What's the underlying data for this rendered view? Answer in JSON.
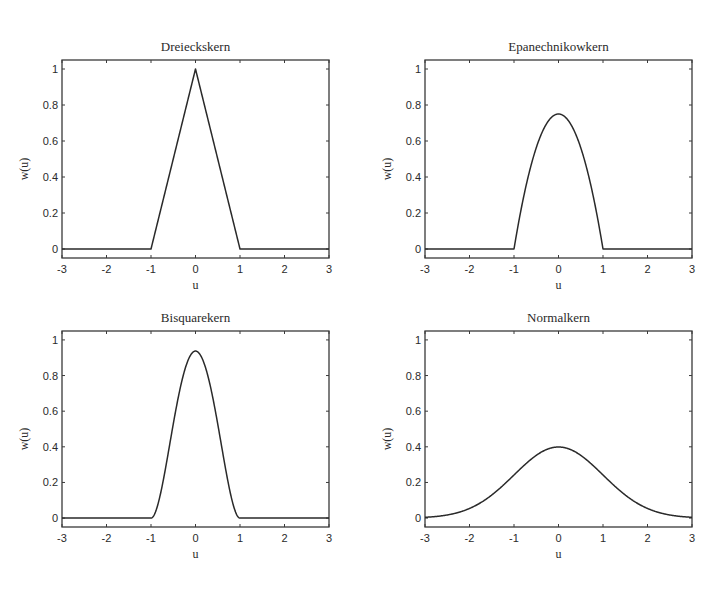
{
  "figure": {
    "background": "#ffffff",
    "line_color": "#2a2a2a"
  },
  "chart_data": [
    {
      "type": "line",
      "title": "Dreieckskern",
      "xlabel": "u",
      "ylabel": "w(u)",
      "xlim": [
        -3,
        3
      ],
      "ylim": [
        -0.05,
        1.05
      ],
      "xticks": [
        -3,
        -2,
        -1,
        0,
        1,
        2,
        3
      ],
      "xtick_labels": [
        "-3",
        "-2",
        "-1",
        "0",
        "1",
        "2",
        "3"
      ],
      "yticks": [
        0,
        0.2,
        0.4,
        0.6,
        0.8,
        1
      ],
      "ytick_labels": [
        "0",
        "0.2",
        "0.4",
        "0.6",
        "0.8",
        "1"
      ],
      "grid": false,
      "kernel": "triangular",
      "x": [
        -3,
        -1,
        0,
        1,
        3
      ],
      "y": [
        0,
        0,
        1,
        0,
        0
      ]
    },
    {
      "type": "line",
      "title": "Epanechnikowkern",
      "xlabel": "u",
      "ylabel": "w(u)",
      "xlim": [
        -3,
        3
      ],
      "ylim": [
        -0.05,
        1.05
      ],
      "xticks": [
        -3,
        -2,
        -1,
        0,
        1,
        2,
        3
      ],
      "xtick_labels": [
        "-3",
        "-2",
        "-1",
        "0",
        "1",
        "2",
        "3"
      ],
      "yticks": [
        0,
        0.2,
        0.4,
        0.6,
        0.8,
        1
      ],
      "ytick_labels": [
        "0",
        "0.2",
        "0.4",
        "0.6",
        "0.8",
        "1"
      ],
      "grid": false,
      "kernel": "epanechnikov",
      "x": [
        -3,
        -1,
        -0.75,
        -0.5,
        -0.25,
        0,
        0.25,
        0.5,
        0.75,
        1,
        3
      ],
      "y": [
        0,
        0,
        0.328,
        0.5625,
        0.703,
        0.75,
        0.703,
        0.5625,
        0.328,
        0,
        0
      ]
    },
    {
      "type": "line",
      "title": "Bisquarekern",
      "xlabel": "u",
      "ylabel": "w(u)",
      "xlim": [
        -3,
        3
      ],
      "ylim": [
        -0.05,
        1.05
      ],
      "xticks": [
        -3,
        -2,
        -1,
        0,
        1,
        2,
        3
      ],
      "xtick_labels": [
        "-3",
        "-2",
        "-1",
        "0",
        "1",
        "2",
        "3"
      ],
      "yticks": [
        0,
        0.2,
        0.4,
        0.6,
        0.8,
        1
      ],
      "ytick_labels": [
        "0",
        "0.2",
        "0.4",
        "0.6",
        "0.8",
        "1"
      ],
      "grid": false,
      "kernel": "biweight",
      "x": [
        -3,
        -1,
        -0.75,
        -0.5,
        -0.25,
        0,
        0.25,
        0.5,
        0.75,
        1,
        3
      ],
      "y": [
        0,
        0,
        0.179,
        0.527,
        0.824,
        0.9375,
        0.824,
        0.527,
        0.179,
        0,
        0
      ]
    },
    {
      "type": "line",
      "title": "Normalkern",
      "xlabel": "u",
      "ylabel": "w(u)",
      "xlim": [
        -3,
        3
      ],
      "ylim": [
        -0.05,
        1.05
      ],
      "xticks": [
        -3,
        -2,
        -1,
        0,
        1,
        2,
        3
      ],
      "xtick_labels": [
        "-3",
        "-2",
        "-1",
        "0",
        "1",
        "2",
        "3"
      ],
      "yticks": [
        0,
        0.2,
        0.4,
        0.6,
        0.8,
        1
      ],
      "ytick_labels": [
        "0",
        "0.2",
        "0.4",
        "0.6",
        "0.8",
        "1"
      ],
      "grid": false,
      "kernel": "gaussian",
      "x": [
        -3,
        -2.5,
        -2,
        -1.5,
        -1,
        -0.5,
        0,
        0.5,
        1,
        1.5,
        2,
        2.5,
        3
      ],
      "y": [
        0.004,
        0.018,
        0.054,
        0.13,
        0.242,
        0.352,
        0.399,
        0.352,
        0.242,
        0.13,
        0.054,
        0.018,
        0.004
      ]
    }
  ]
}
